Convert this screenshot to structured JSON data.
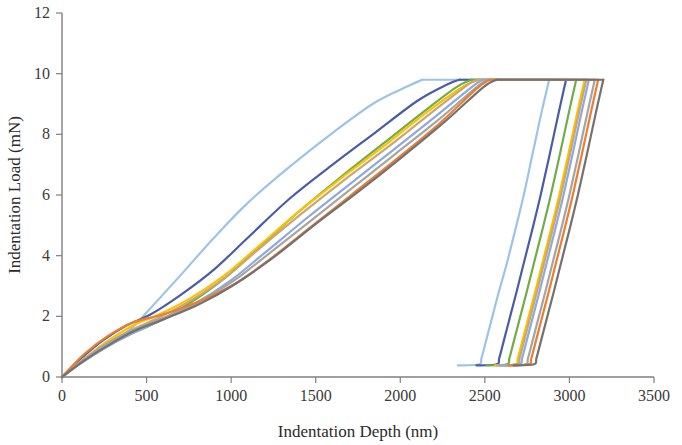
{
  "chart_data": {
    "type": "line",
    "title": "",
    "xlabel": "Indentation Depth (nm)",
    "ylabel": "Indentation Load (mN)",
    "xlim": [
      0,
      3500
    ],
    "ylim": [
      0,
      12
    ],
    "xticks": [
      0,
      500,
      1000,
      1500,
      2000,
      2500,
      3000,
      3500
    ],
    "yticks": [
      0,
      2,
      4,
      6,
      8,
      10,
      12
    ],
    "xtick_labels": [
      "0",
      "500",
      "1000",
      "1500",
      "2000",
      "2500",
      "3000",
      "3500"
    ],
    "ytick_labels": [
      "0",
      "2",
      "4",
      "6",
      "8",
      "10",
      "12"
    ],
    "grid": false,
    "legend": "none",
    "peak_load_mN": 9.8,
    "series": [
      {
        "name": "indent-1",
        "color": "#9DC3E6",
        "loading": [
          [
            0,
            0
          ],
          [
            120,
            0.55
          ],
          [
            250,
            1.05
          ],
          [
            400,
            1.55
          ],
          [
            520,
            2.25
          ],
          [
            700,
            3.35
          ],
          [
            900,
            4.6
          ],
          [
            1100,
            5.75
          ],
          [
            1350,
            6.95
          ],
          [
            1600,
            8.05
          ],
          [
            1850,
            9.05
          ],
          [
            2050,
            9.6
          ],
          [
            2130,
            9.8
          ]
        ],
        "hold": [
          [
            2130,
            9.8
          ],
          [
            2880,
            9.8
          ]
        ],
        "unloading": [
          [
            2880,
            9.8
          ],
          [
            2830,
            8.6
          ],
          [
            2780,
            7.3
          ],
          [
            2730,
            6.0
          ],
          [
            2680,
            4.85
          ],
          [
            2630,
            3.75
          ],
          [
            2580,
            2.75
          ],
          [
            2540,
            1.9
          ],
          [
            2505,
            1.15
          ],
          [
            2480,
            0.62
          ],
          [
            2465,
            0.42
          ],
          [
            2340,
            0.38
          ]
        ]
      },
      {
        "name": "indent-2",
        "color": "#4A5CA8",
        "loading": [
          [
            0,
            0
          ],
          [
            110,
            0.6
          ],
          [
            240,
            1.2
          ],
          [
            380,
            1.7
          ],
          [
            520,
            2.05
          ],
          [
            700,
            2.7
          ],
          [
            900,
            3.55
          ],
          [
            1100,
            4.6
          ],
          [
            1350,
            5.9
          ],
          [
            1600,
            7.0
          ],
          [
            1850,
            8.05
          ],
          [
            2100,
            9.1
          ],
          [
            2280,
            9.65
          ],
          [
            2350,
            9.8
          ]
        ],
        "hold": [
          [
            2350,
            9.8
          ],
          [
            2980,
            9.8
          ]
        ],
        "unloading": [
          [
            2980,
            9.8
          ],
          [
            2930,
            8.55
          ],
          [
            2880,
            7.25
          ],
          [
            2830,
            6.0
          ],
          [
            2780,
            4.85
          ],
          [
            2730,
            3.75
          ],
          [
            2685,
            2.75
          ],
          [
            2645,
            1.9
          ],
          [
            2610,
            1.15
          ],
          [
            2585,
            0.62
          ],
          [
            2570,
            0.42
          ],
          [
            2450,
            0.38
          ]
        ]
      },
      {
        "name": "indent-3",
        "color": "#70AD47",
        "loading": [
          [
            0,
            0
          ],
          [
            110,
            0.45
          ],
          [
            250,
            0.95
          ],
          [
            400,
            1.4
          ],
          [
            560,
            1.8
          ],
          [
            760,
            2.45
          ],
          [
            960,
            3.25
          ],
          [
            1160,
            4.25
          ],
          [
            1400,
            5.45
          ],
          [
            1650,
            6.6
          ],
          [
            1900,
            7.7
          ],
          [
            2150,
            8.8
          ],
          [
            2330,
            9.55
          ],
          [
            2420,
            9.8
          ]
        ],
        "hold": [
          [
            2420,
            9.8
          ],
          [
            3040,
            9.8
          ]
        ],
        "unloading": [
          [
            3040,
            9.8
          ],
          [
            2990,
            8.55
          ],
          [
            2940,
            7.25
          ],
          [
            2890,
            6.0
          ],
          [
            2840,
            4.85
          ],
          [
            2790,
            3.75
          ],
          [
            2745,
            2.75
          ],
          [
            2705,
            1.9
          ],
          [
            2670,
            1.15
          ],
          [
            2645,
            0.62
          ],
          [
            2630,
            0.42
          ],
          [
            2510,
            0.38
          ]
        ]
      },
      {
        "name": "indent-4",
        "color": "#FFC000",
        "loading": [
          [
            0,
            0
          ],
          [
            120,
            0.55
          ],
          [
            260,
            1.15
          ],
          [
            420,
            1.7
          ],
          [
            570,
            2.05
          ],
          [
            760,
            2.6
          ],
          [
            960,
            3.35
          ],
          [
            1160,
            4.3
          ],
          [
            1400,
            5.45
          ],
          [
            1650,
            6.55
          ],
          [
            1900,
            7.6
          ],
          [
            2150,
            8.7
          ],
          [
            2380,
            9.6
          ],
          [
            2470,
            9.8
          ]
        ],
        "hold": [
          [
            2470,
            9.8
          ],
          [
            3090,
            9.8
          ]
        ],
        "unloading": [
          [
            3090,
            9.8
          ],
          [
            3040,
            8.55
          ],
          [
            2990,
            7.25
          ],
          [
            2940,
            6.0
          ],
          [
            2890,
            4.85
          ],
          [
            2840,
            3.75
          ],
          [
            2795,
            2.75
          ],
          [
            2755,
            1.9
          ],
          [
            2720,
            1.15
          ],
          [
            2695,
            0.62
          ],
          [
            2680,
            0.42
          ],
          [
            2560,
            0.38
          ]
        ]
      },
      {
        "name": "indent-5",
        "color": "#C9A870",
        "loading": [
          [
            0,
            0
          ],
          [
            115,
            0.5
          ],
          [
            250,
            1.05
          ],
          [
            410,
            1.55
          ],
          [
            570,
            1.95
          ],
          [
            770,
            2.55
          ],
          [
            970,
            3.3
          ],
          [
            1170,
            4.25
          ],
          [
            1420,
            5.4
          ],
          [
            1670,
            6.5
          ],
          [
            1920,
            7.55
          ],
          [
            2170,
            8.65
          ],
          [
            2390,
            9.6
          ],
          [
            2460,
            9.8
          ]
        ],
        "hold": [
          [
            2460,
            9.8
          ],
          [
            3100,
            9.8
          ]
        ],
        "unloading": [
          [
            3100,
            9.8
          ],
          [
            3050,
            8.55
          ],
          [
            3000,
            7.25
          ],
          [
            2950,
            6.0
          ],
          [
            2900,
            4.85
          ],
          [
            2850,
            3.75
          ],
          [
            2805,
            2.75
          ],
          [
            2765,
            1.9
          ],
          [
            2730,
            1.15
          ],
          [
            2705,
            0.62
          ],
          [
            2690,
            0.42
          ],
          [
            2570,
            0.38
          ]
        ]
      },
      {
        "name": "indent-6",
        "color": "#8EA9DB",
        "loading": [
          [
            0,
            0
          ],
          [
            110,
            0.45
          ],
          [
            250,
            0.95
          ],
          [
            420,
            1.45
          ],
          [
            580,
            1.85
          ],
          [
            780,
            2.4
          ],
          [
            990,
            3.15
          ],
          [
            1200,
            4.1
          ],
          [
            1450,
            5.25
          ],
          [
            1700,
            6.35
          ],
          [
            1950,
            7.45
          ],
          [
            2200,
            8.55
          ],
          [
            2420,
            9.55
          ],
          [
            2490,
            9.8
          ]
        ],
        "hold": [
          [
            2490,
            9.8
          ],
          [
            3115,
            9.8
          ]
        ],
        "unloading": [
          [
            3115,
            9.8
          ],
          [
            3065,
            8.55
          ],
          [
            3015,
            7.25
          ],
          [
            2965,
            6.0
          ],
          [
            2915,
            4.85
          ],
          [
            2865,
            3.75
          ],
          [
            2820,
            2.75
          ],
          [
            2780,
            1.9
          ],
          [
            2745,
            1.15
          ],
          [
            2720,
            0.62
          ],
          [
            2705,
            0.42
          ],
          [
            2590,
            0.38
          ]
        ]
      },
      {
        "name": "indent-7",
        "color": "#A5A5A5",
        "loading": [
          [
            0,
            0
          ],
          [
            110,
            0.5
          ],
          [
            250,
            1.05
          ],
          [
            420,
            1.55
          ],
          [
            600,
            1.95
          ],
          [
            800,
            2.45
          ],
          [
            1010,
            3.15
          ],
          [
            1220,
            4.05
          ],
          [
            1470,
            5.15
          ],
          [
            1720,
            6.25
          ],
          [
            1970,
            7.35
          ],
          [
            2230,
            8.5
          ],
          [
            2450,
            9.55
          ],
          [
            2520,
            9.8
          ]
        ],
        "hold": [
          [
            2520,
            9.8
          ],
          [
            3150,
            9.8
          ]
        ],
        "unloading": [
          [
            3150,
            9.8
          ],
          [
            3100,
            8.55
          ],
          [
            3050,
            7.25
          ],
          [
            3000,
            6.0
          ],
          [
            2950,
            4.85
          ],
          [
            2900,
            3.75
          ],
          [
            2855,
            2.75
          ],
          [
            2815,
            1.9
          ],
          [
            2780,
            1.15
          ],
          [
            2755,
            0.62
          ],
          [
            2740,
            0.42
          ],
          [
            2620,
            0.38
          ]
        ]
      },
      {
        "name": "indent-8",
        "color": "#ED7D31",
        "loading": [
          [
            0,
            0
          ],
          [
            130,
            0.75
          ],
          [
            270,
            1.35
          ],
          [
            420,
            1.8
          ],
          [
            590,
            2.05
          ],
          [
            790,
            2.45
          ],
          [
            1000,
            3.0
          ],
          [
            1210,
            3.8
          ],
          [
            1460,
            4.9
          ],
          [
            1710,
            6.0
          ],
          [
            1970,
            7.15
          ],
          [
            2230,
            8.35
          ],
          [
            2450,
            9.5
          ],
          [
            2530,
            9.8
          ]
        ],
        "hold": [
          [
            2530,
            9.8
          ],
          [
            3170,
            9.8
          ]
        ],
        "unloading": [
          [
            3170,
            9.8
          ],
          [
            3120,
            8.55
          ],
          [
            3070,
            7.25
          ],
          [
            3020,
            6.0
          ],
          [
            2970,
            4.85
          ],
          [
            2920,
            3.75
          ],
          [
            2875,
            2.75
          ],
          [
            2835,
            1.9
          ],
          [
            2800,
            1.15
          ],
          [
            2775,
            0.62
          ],
          [
            2760,
            0.42
          ],
          [
            2640,
            0.38
          ]
        ]
      },
      {
        "name": "indent-9",
        "color": "#767171",
        "loading": [
          [
            0,
            0
          ],
          [
            120,
            0.5
          ],
          [
            260,
            1.0
          ],
          [
            420,
            1.5
          ],
          [
            600,
            1.9
          ],
          [
            810,
            2.4
          ],
          [
            1020,
            3.05
          ],
          [
            1240,
            3.9
          ],
          [
            1490,
            5.0
          ],
          [
            1750,
            6.1
          ],
          [
            2010,
            7.25
          ],
          [
            2270,
            8.45
          ],
          [
            2490,
            9.55
          ],
          [
            2570,
            9.8
          ]
        ],
        "hold": [
          [
            2570,
            9.8
          ],
          [
            3200,
            9.8
          ]
        ],
        "unloading": [
          [
            3200,
            9.8
          ],
          [
            3150,
            8.55
          ],
          [
            3100,
            7.25
          ],
          [
            3050,
            6.0
          ],
          [
            3000,
            4.85
          ],
          [
            2950,
            3.75
          ],
          [
            2905,
            2.75
          ],
          [
            2865,
            1.9
          ],
          [
            2830,
            1.15
          ],
          [
            2805,
            0.62
          ],
          [
            2790,
            0.42
          ],
          [
            2670,
            0.38
          ]
        ]
      }
    ]
  },
  "axes": {
    "x_origin_px": 62,
    "y_origin_px": 377,
    "x_end_px": 654,
    "y_top_px": 13
  }
}
